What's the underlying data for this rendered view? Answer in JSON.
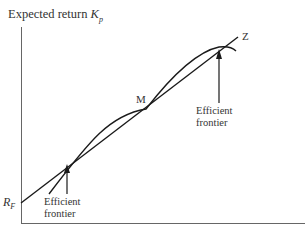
{
  "diagram": {
    "type": "capital-market-line",
    "y_axis_label": {
      "text": "Expected return ",
      "symbol": "K",
      "subscript": "p"
    },
    "risk_free_label": {
      "symbol": "R",
      "subscript": "F"
    },
    "line_end_label": "Z",
    "tangency_label": "M",
    "annotations": [
      {
        "line1": "Efficient",
        "line2": "frontier",
        "position": "upper-right"
      },
      {
        "line1": "Efficient",
        "line2": "frontier",
        "position": "lower-left"
      }
    ],
    "colors": {
      "axis": "#555555",
      "line": "#1a1a1a",
      "text": "#333333"
    }
  }
}
